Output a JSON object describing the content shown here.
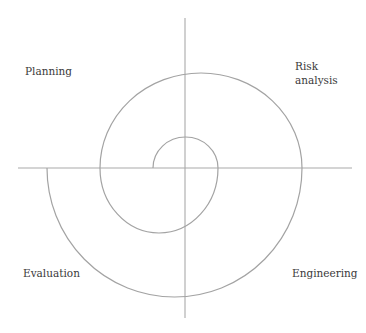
{
  "diagram": {
    "type": "spiral-model",
    "quadrants": {
      "top_left": "Planning",
      "top_right": [
        "Risk",
        "analysis"
      ],
      "bottom_left": "Evaluation",
      "bottom_right": "Engineering"
    },
    "colors": {
      "line": "#a3a3a3",
      "text": "#3a3a3a",
      "background": "#ffffff"
    }
  }
}
